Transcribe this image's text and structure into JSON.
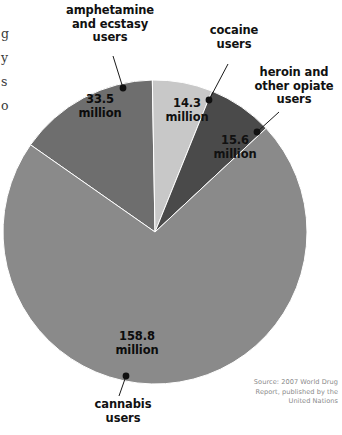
{
  "figure": {
    "background": "#ffffff",
    "source_note": "Source: 2007 World Drug\nReport, published by the\nUnited Nations",
    "cut_off_text": "g\ny\ns\no"
  },
  "chart_data": {
    "type": "pie",
    "title": "",
    "unit": "million users",
    "total": 222.2,
    "center": {
      "x": 155,
      "y": 232
    },
    "radius": 152,
    "categories": [
      "amphetamine and ecstasy users",
      "cocaine users",
      "heroin and other opiate users",
      "cannabis users"
    ],
    "values": [
      33.5,
      14.3,
      15.6,
      158.8
    ],
    "value_labels": [
      "33.5\nmillion",
      "14.3\nmillion",
      "15.6\nmillion",
      "158.8\nmillion"
    ],
    "colors": [
      "#6e6e6e",
      "#c8c8c8",
      "#4a4a4a",
      "#8a8a8a"
    ],
    "legend": "none",
    "labels_style": "leader-line callouts",
    "slices": [
      {
        "name": "amphetamine and ecstasy users",
        "label": "amphetamine\nand ecstasy\nusers",
        "value_label": "33.5\nmillion",
        "value": 33.5,
        "percent": 15.1,
        "color": "#6e6e6e",
        "start_angle": 305,
        "end_angle": 359,
        "dot": {
          "x": 123,
          "y": 88
        },
        "leader_from": {
          "x": 123,
          "y": 88
        },
        "leader_to": {
          "x": 113,
          "y": 56
        }
      },
      {
        "name": "cocaine users",
        "label": "cocaine\nusers",
        "value_label": "14.3\nmillion",
        "value": 14.3,
        "percent": 6.4,
        "color": "#c8c8c8",
        "start_angle": 359,
        "end_angle": 382,
        "dot": {
          "x": 209,
          "y": 100
        },
        "leader_from": {
          "x": 209,
          "y": 100
        },
        "leader_to": {
          "x": 228,
          "y": 64
        }
      },
      {
        "name": "heroin and other opiate users",
        "label": "heroin and\nother opiate\nusers",
        "value_label": "15.6\nmillion",
        "value": 15.6,
        "percent": 7.0,
        "color": "#4a4a4a",
        "start_angle": 382,
        "end_angle": 407,
        "dot": {
          "x": 257,
          "y": 132
        },
        "leader_from": {
          "x": 257,
          "y": 132
        },
        "leader_to": {
          "x": 279,
          "y": 112
        }
      },
      {
        "name": "cannabis users",
        "label": "cannabis\nusers",
        "value_label": "158.8\nmillion",
        "value": 158.8,
        "percent": 71.5,
        "color": "#8a8a8a",
        "start_angle": 407,
        "end_angle": 665,
        "dot": {
          "x": 126,
          "y": 376
        },
        "leader_from": {
          "x": 126,
          "y": 376
        },
        "leader_to": {
          "x": 119,
          "y": 396
        }
      }
    ]
  }
}
